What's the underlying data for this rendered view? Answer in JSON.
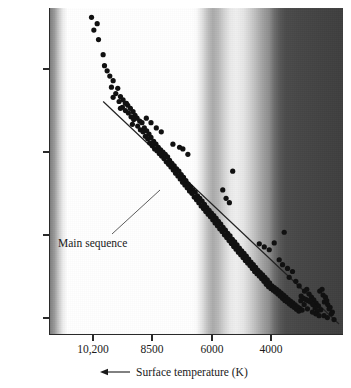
{
  "figure": {
    "kind": "hertzsprung-russell-diagram",
    "background": "#ffffff",
    "marker_color": "#111111",
    "axis_color": "#2a2a2a"
  },
  "axes": {
    "y": {
      "title_prefix": "Luminosity L",
      "title_symbol": "☉",
      "title_arrow": "up-arrow",
      "scale": "log",
      "tick_labels": [
        "10",
        "10",
        "1",
        "0.1"
      ],
      "tick_values": [
        100,
        10,
        1,
        0.1
      ],
      "tick_exponents": [
        "2",
        "",
        "",
        ""
      ],
      "tick_y_px": [
        69,
        152,
        235,
        318
      ],
      "limits": [
        0.055,
        560
      ]
    },
    "x": {
      "title": "Surface temperature (K)",
      "title_arrow": "left-arrow",
      "tick_labels": [
        "10,200",
        "8500",
        "6000",
        "4000"
      ],
      "tick_values": [
        10200,
        8500,
        6000,
        4000
      ],
      "tick_x_px": [
        93,
        152,
        212,
        271
      ],
      "direction": "decreasing-right"
    }
  },
  "annotations": [
    {
      "name": "main-sequence-label",
      "text": "Main sequence",
      "leader_line": true
    }
  ],
  "chart_data": {
    "type": "scatter",
    "title": "",
    "xlabel": "Surface temperature (K)",
    "ylabel": "Luminosity L☉",
    "xlim": [
      11600,
      2750
    ],
    "ylim": [
      0.055,
      560
    ],
    "xscale": "linear-reversed",
    "yscale": "log",
    "grid": false,
    "legend": null,
    "series": [
      {
        "name": "stars",
        "marker": "filled-circle",
        "color": "#111111",
        "points": [
          [
            10350,
            430
          ],
          [
            10180,
            360
          ],
          [
            10280,
            300
          ],
          [
            10140,
            230
          ],
          [
            10000,
            150
          ],
          [
            9960,
            110
          ],
          [
            9880,
            95
          ],
          [
            9800,
            82
          ],
          [
            9700,
            72
          ],
          [
            9750,
            60
          ],
          [
            9560,
            58
          ],
          [
            9620,
            50
          ],
          [
            9480,
            46
          ],
          [
            9700,
            45
          ],
          [
            9400,
            42
          ],
          [
            9520,
            40
          ],
          [
            9330,
            38
          ],
          [
            9260,
            36
          ],
          [
            9420,
            34
          ],
          [
            9180,
            33
          ],
          [
            9330,
            31
          ],
          [
            9100,
            30
          ],
          [
            9240,
            29
          ],
          [
            9040,
            27
          ],
          [
            9160,
            26
          ],
          [
            8980,
            25
          ],
          [
            9080,
            24
          ],
          [
            8900,
            23
          ],
          [
            9300,
            38
          ],
          [
            9480,
            33
          ],
          [
            9120,
            21
          ],
          [
            8830,
            22
          ],
          [
            8960,
            20
          ],
          [
            8760,
            19
          ],
          [
            8880,
            18
          ],
          [
            8690,
            17.5
          ],
          [
            8800,
            17
          ],
          [
            8620,
            16
          ],
          [
            8730,
            15
          ],
          [
            8560,
            14.5
          ],
          [
            8660,
            14
          ],
          [
            8480,
            13
          ],
          [
            8600,
            12.5
          ],
          [
            8410,
            12
          ],
          [
            8520,
            11.5
          ],
          [
            8340,
            11
          ],
          [
            8450,
            10.5
          ],
          [
            8270,
            10.2
          ],
          [
            8380,
            10
          ],
          [
            8200,
            9.6
          ],
          [
            8310,
            9.2
          ],
          [
            8130,
            9
          ],
          [
            8240,
            8.6
          ],
          [
            8060,
            8.4
          ],
          [
            8170,
            8
          ],
          [
            8000,
            7.6
          ],
          [
            8100,
            7.3
          ],
          [
            7930,
            7
          ],
          [
            8030,
            6.8
          ],
          [
            7860,
            6.5
          ],
          [
            7960,
            6.3
          ],
          [
            7790,
            6
          ],
          [
            7890,
            5.8
          ],
          [
            8700,
            25
          ],
          [
            8560,
            22
          ],
          [
            8400,
            19
          ],
          [
            8250,
            17
          ],
          [
            7720,
            5.6
          ],
          [
            7820,
            5.3
          ],
          [
            7650,
            5.1
          ],
          [
            7750,
            4.9
          ],
          [
            7580,
            4.7
          ],
          [
            7680,
            4.5
          ],
          [
            7510,
            4.3
          ],
          [
            7610,
            4.1
          ],
          [
            7440,
            3.9
          ],
          [
            7540,
            3.8
          ],
          [
            7370,
            3.6
          ],
          [
            7470,
            3.5
          ],
          [
            7300,
            3.3
          ],
          [
            7400,
            3.2
          ],
          [
            7230,
            3.1
          ],
          [
            7330,
            3.0
          ],
          [
            7160,
            2.8
          ],
          [
            7260,
            2.7
          ],
          [
            7090,
            2.6
          ],
          [
            7190,
            2.5
          ],
          [
            7020,
            2.4
          ],
          [
            7120,
            2.3
          ],
          [
            6950,
            2.2
          ],
          [
            7050,
            2.1
          ],
          [
            7700,
            11
          ],
          [
            7600,
            10.5
          ],
          [
            7450,
            9
          ],
          [
            7900,
            12
          ],
          [
            6880,
            2.0
          ],
          [
            6980,
            1.95
          ],
          [
            6810,
            1.85
          ],
          [
            6910,
            1.8
          ],
          [
            6740,
            1.72
          ],
          [
            6840,
            1.66
          ],
          [
            6670,
            1.6
          ],
          [
            6770,
            1.55
          ],
          [
            6600,
            1.48
          ],
          [
            6700,
            1.42
          ],
          [
            6530,
            1.36
          ],
          [
            6630,
            1.3
          ],
          [
            6460,
            1.26
          ],
          [
            6560,
            1.2
          ],
          [
            6390,
            1.15
          ],
          [
            6490,
            1.1
          ],
          [
            6320,
            1.06
          ],
          [
            6420,
            1.02
          ],
          [
            6250,
            0.97
          ],
          [
            6350,
            0.93
          ],
          [
            6180,
            0.9
          ],
          [
            6280,
            0.86
          ],
          [
            6110,
            0.82
          ],
          [
            6210,
            0.79
          ],
          [
            6040,
            0.76
          ],
          [
            6140,
            0.73
          ],
          [
            5970,
            0.7
          ],
          [
            6070,
            0.67
          ],
          [
            6100,
            5.6
          ],
          [
            6400,
            3.3
          ],
          [
            6300,
            2.6
          ],
          [
            6200,
            2.3
          ],
          [
            5900,
            0.64
          ],
          [
            6000,
            0.62
          ],
          [
            5830,
            0.59
          ],
          [
            5930,
            0.57
          ],
          [
            5760,
            0.55
          ],
          [
            5860,
            0.53
          ],
          [
            5690,
            0.51
          ],
          [
            5790,
            0.49
          ],
          [
            5620,
            0.47
          ],
          [
            5720,
            0.45
          ],
          [
            5550,
            0.43
          ],
          [
            5650,
            0.42
          ],
          [
            5480,
            0.4
          ],
          [
            5580,
            0.39
          ],
          [
            5410,
            0.37
          ],
          [
            5510,
            0.36
          ],
          [
            5340,
            0.34
          ],
          [
            5440,
            0.33
          ],
          [
            5270,
            0.32
          ],
          [
            5370,
            0.31
          ],
          [
            5200,
            0.3
          ],
          [
            5300,
            0.29
          ],
          [
            5130,
            0.28
          ],
          [
            5230,
            0.27
          ],
          [
            5060,
            0.26
          ],
          [
            5160,
            0.25
          ],
          [
            4990,
            0.24
          ],
          [
            5090,
            0.23
          ],
          [
            5300,
            0.72
          ],
          [
            5150,
            0.66
          ],
          [
            5000,
            0.61
          ],
          [
            4850,
            0.74
          ],
          [
            4920,
            0.22
          ],
          [
            5020,
            0.215
          ],
          [
            4850,
            0.21
          ],
          [
            4950,
            0.205
          ],
          [
            4780,
            0.2
          ],
          [
            4880,
            0.195
          ],
          [
            4710,
            0.19
          ],
          [
            4810,
            0.185
          ],
          [
            4640,
            0.18
          ],
          [
            4740,
            0.175
          ],
          [
            4570,
            0.17
          ],
          [
            4670,
            0.165
          ],
          [
            4500,
            0.16
          ],
          [
            4600,
            0.155
          ],
          [
            4430,
            0.15
          ],
          [
            4530,
            0.146
          ],
          [
            4360,
            0.143
          ],
          [
            4460,
            0.14
          ],
          [
            4290,
            0.136
          ],
          [
            4390,
            0.132
          ],
          [
            4220,
            0.129
          ],
          [
            4320,
            0.126
          ],
          [
            4150,
            0.122
          ],
          [
            4250,
            0.12
          ],
          [
            4080,
            0.117
          ],
          [
            4180,
            0.114
          ],
          [
            4010,
            0.111
          ],
          [
            4110,
            0.108
          ],
          [
            4550,
            1.0
          ],
          [
            4700,
            0.46
          ],
          [
            4600,
            0.4
          ],
          [
            4450,
            0.36
          ],
          [
            4300,
            0.33
          ],
          [
            4400,
            0.28
          ],
          [
            4200,
            0.25
          ],
          [
            4100,
            0.22
          ],
          [
            3940,
            0.19
          ],
          [
            4040,
            0.165
          ],
          [
            3870,
            0.2
          ],
          [
            3970,
            0.155
          ],
          [
            3800,
            0.175
          ],
          [
            3900,
            0.15
          ],
          [
            3730,
            0.16
          ],
          [
            3830,
            0.145
          ],
          [
            3660,
            0.148
          ],
          [
            3760,
            0.14
          ],
          [
            3590,
            0.135
          ],
          [
            3690,
            0.13
          ],
          [
            3520,
            0.125
          ],
          [
            3620,
            0.118
          ],
          [
            3450,
            0.112
          ],
          [
            3550,
            0.108
          ],
          [
            3380,
            0.17
          ],
          [
            3480,
            0.19
          ],
          [
            3310,
            0.16
          ],
          [
            3410,
            0.2
          ],
          [
            3240,
            0.13
          ],
          [
            3340,
            0.14
          ],
          [
            3170,
            0.12
          ],
          [
            3270,
            0.145
          ],
          [
            3100,
            0.105
          ],
          [
            3200,
            0.115
          ],
          [
            3050,
            0.085
          ],
          [
            3130,
            0.1
          ],
          [
            3600,
            0.1
          ],
          [
            3700,
            0.105
          ],
          [
            3500,
            0.095
          ],
          [
            3850,
            0.115
          ],
          [
            3950,
            0.13
          ],
          [
            4050,
            0.145
          ],
          [
            3350,
            0.095
          ],
          [
            3250,
            0.09
          ]
        ]
      }
    ],
    "fit_line": {
      "name": "main-sequence",
      "label": "Main sequence",
      "points": [
        [
          10000,
          40
        ],
        [
          2900,
          0.075
        ]
      ]
    }
  }
}
